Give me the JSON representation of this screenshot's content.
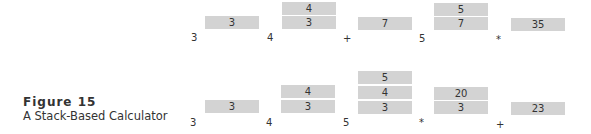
{
  "figure": {
    "title": "Figure 15",
    "subtitle": "A Stack-Based Calculator"
  },
  "rows": [
    {
      "name": "top",
      "tokens": [
        "3",
        "4",
        "+",
        "7",
        "5",
        "*",
        "35"
      ],
      "stacks": [
        [
          "3"
        ],
        [
          "4",
          "3"
        ],
        [
          "7"
        ],
        [
          "5",
          "7"
        ],
        [
          "35"
        ]
      ],
      "inputs": [
        "3",
        "4",
        "+",
        "5",
        "*"
      ]
    },
    {
      "name": "bottom",
      "stacks": [
        [
          "3"
        ],
        [
          "4",
          "3"
        ],
        [
          "5",
          "4",
          "3"
        ],
        [
          "20",
          "3"
        ],
        [
          "23"
        ]
      ],
      "inputs": [
        "3",
        "4",
        "5",
        "*",
        "+"
      ]
    }
  ],
  "colors": {
    "box": "#d3d3d3",
    "text": "#333333"
  }
}
